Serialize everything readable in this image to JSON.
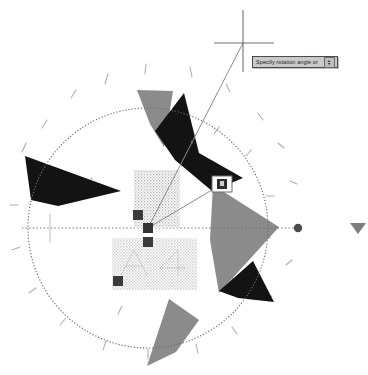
{
  "app": {
    "command_prompt": "Specify rotation angle or",
    "spinner_icon": "down-arrow-spinner-icon",
    "cursor_icon": "crosshair-cursor-icon"
  },
  "prompt": {
    "text": "Specify rotation angle or",
    "spinner_up": "▴",
    "spinner_down": "▾"
  },
  "geometry": {
    "base_point": {
      "x": 148,
      "y": 228
    },
    "cursor": {
      "x": 243,
      "y": 43
    },
    "hot_grip": {
      "x": 222,
      "y": 184
    },
    "circle": {
      "cx": 148,
      "cy": 228,
      "r": 120
    },
    "center_dot": {
      "x": 298,
      "y": 228
    },
    "edge_marker": {
      "x": 357,
      "y": 228
    }
  },
  "colors": {
    "dark_fill": "#141414",
    "gray_fill": "#8a8a8a",
    "hatch": "#c3c3c3",
    "grip_fill": "#3a3a3a",
    "hot_grip_border": "#ffffff",
    "line": "#8e8e8e",
    "prompt_bg": "#c9c9c9",
    "prompt_border": "#4a4a4a",
    "background": "#ffffff"
  },
  "objects": {
    "dark_triangles": [
      {
        "name": "dark-triangle-west",
        "points": "26,157 118,192 55,204 28,200"
      },
      {
        "name": "dark-triangle-north",
        "points": "156,132 182,94 196,152 241,176 214,190 176,160"
      },
      {
        "name": "dark-triangle-southeast",
        "points": "220,290 252,262 272,300 236,297"
      }
    ],
    "gray_triangles": [
      {
        "name": "gray-triangle-north",
        "points": "137,90 172,91 163,146"
      },
      {
        "name": "gray-triangle-east",
        "points": "214,186 278,227 218,292"
      },
      {
        "name": "gray-triangle-south",
        "points": "148,365 168,300 196,318"
      }
    ],
    "hatched_rects": [
      {
        "name": "hatch-rect-upper",
        "x": 134,
        "y": 170,
        "w": 46,
        "h": 58
      },
      {
        "name": "hatch-rect-lower",
        "x": 112,
        "y": 238,
        "w": 85,
        "h": 52
      }
    ],
    "grips": [
      {
        "name": "grip-upper",
        "x": 138,
        "y": 215
      },
      {
        "name": "grip-base",
        "x": 148,
        "y": 228
      },
      {
        "name": "grip-middle",
        "x": 148,
        "y": 242
      },
      {
        "name": "grip-lower",
        "x": 118,
        "y": 281
      }
    ],
    "tick_marks": 18
  }
}
